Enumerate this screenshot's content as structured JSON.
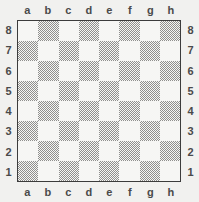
{
  "figure": {
    "kind": "chessboard-diagram",
    "orientation": "white-bottom",
    "background_color": "#f1f1ef",
    "border_color": "#3c3c3c",
    "light_square_color": "#f6f6f4",
    "dark_square_color": "#8f8f8d",
    "label_color": "#4a4a4a"
  },
  "coordinates": {
    "files_top": [
      "a",
      "b",
      "c",
      "d",
      "e",
      "f",
      "g",
      "h"
    ],
    "files_bottom": [
      "a",
      "b",
      "c",
      "d",
      "e",
      "f",
      "g",
      "h"
    ],
    "ranks_left": [
      "8",
      "7",
      "6",
      "5",
      "4",
      "3",
      "2",
      "1"
    ],
    "ranks_right": [
      "8",
      "7",
      "6",
      "5",
      "4",
      "3",
      "2",
      "1"
    ]
  },
  "chart_data": {
    "type": "heatmap",
    "title": "",
    "xlabel": "",
    "ylabel": "",
    "categories": [
      "a",
      "b",
      "c",
      "d",
      "e",
      "f",
      "g",
      "h"
    ],
    "rows": [
      "8",
      "7",
      "6",
      "5",
      "4",
      "3",
      "2",
      "1"
    ],
    "legend": [
      "light",
      "dark"
    ],
    "grid": true,
    "values": [
      [
        "light",
        "dark",
        "light",
        "dark",
        "light",
        "dark",
        "light",
        "dark"
      ],
      [
        "dark",
        "light",
        "dark",
        "light",
        "dark",
        "light",
        "dark",
        "light"
      ],
      [
        "light",
        "dark",
        "light",
        "dark",
        "light",
        "dark",
        "light",
        "dark"
      ],
      [
        "dark",
        "light",
        "dark",
        "light",
        "dark",
        "light",
        "dark",
        "light"
      ],
      [
        "light",
        "dark",
        "light",
        "dark",
        "light",
        "dark",
        "light",
        "dark"
      ],
      [
        "dark",
        "light",
        "dark",
        "light",
        "dark",
        "light",
        "dark",
        "light"
      ],
      [
        "light",
        "dark",
        "light",
        "dark",
        "light",
        "dark",
        "light",
        "dark"
      ],
      [
        "dark",
        "light",
        "dark",
        "light",
        "dark",
        "light",
        "dark",
        "light"
      ]
    ]
  }
}
